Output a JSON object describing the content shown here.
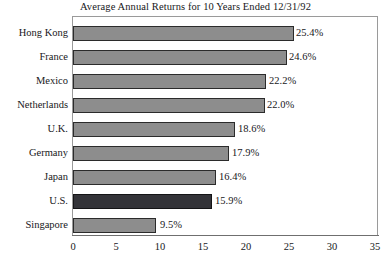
{
  "chart_data": {
    "type": "bar",
    "orientation": "horizontal",
    "title": "Average Annual Returns for 10 Years Ended 12/31/92",
    "xlabel": "",
    "ylabel": "",
    "xlim": [
      0,
      35
    ],
    "xticks": [
      0,
      5,
      10,
      15,
      20,
      25,
      30,
      35
    ],
    "grid": false,
    "legend": null,
    "categories": [
      "Hong Kong",
      "France",
      "Mexico",
      "Netherlands",
      "U.K.",
      "Germany",
      "Japan",
      "U.S.",
      "Singapore"
    ],
    "values": [
      25.4,
      24.6,
      22.2,
      22.0,
      18.6,
      17.9,
      16.4,
      15.9,
      9.5
    ],
    "data_labels": [
      "25.4%",
      "24.6%",
      "22.2%",
      "22.0%",
      "18.6%",
      "17.9%",
      "16.4%",
      "15.9%",
      "9.5%"
    ],
    "highlighted_category": "U.S.",
    "colors": {
      "bar": "#8d8d8d",
      "bar_highlight": "#333338",
      "bar_outline": "#2b2b2b",
      "frame": "#9a9a9a",
      "text": "#17171a",
      "background": "#ffffff"
    }
  }
}
